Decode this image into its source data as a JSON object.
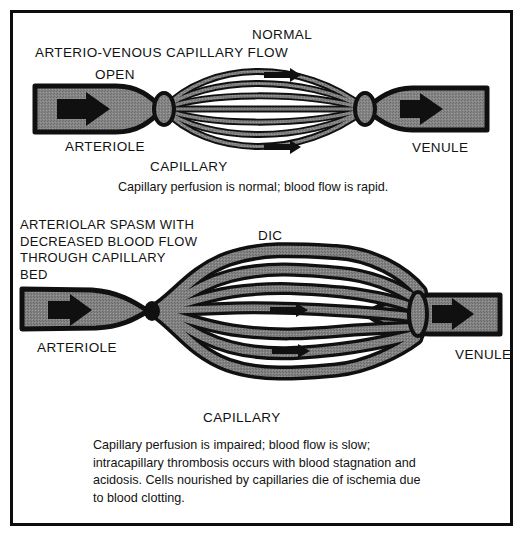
{
  "figure": {
    "background_color": "#ffffff",
    "border_color": "#0d0d0d",
    "vessel_fill_color": "#808080",
    "vessel_outline_color": "#101010",
    "arrow_color": "#101010",
    "text_color": "#121212"
  },
  "panels": [
    {
      "id": "normal",
      "title_top": "NORMAL",
      "title_main": "ARTERIO-VENOUS CAPILLARY FLOW",
      "open_label": "OPEN",
      "arteriole_label": "ARTERIOLE",
      "capillary_label": "CAPILLARY",
      "venule_label": "VENULE",
      "caption": "Capillary perfusion is normal; blood flow is rapid.",
      "flow_arrows": 3,
      "capillary_strands": 7,
      "capillary_shape": "smooth-lens"
    },
    {
      "id": "dic",
      "title_main": "DIC",
      "condition_label": "ARTERIOLAR SPASM WITH\nDECREASED BLOOD FLOW\nTHROUGH CAPILLARY\nBED",
      "arteriole_label": "ARTERIOLE",
      "capillary_label": "CAPILLARY",
      "venule_label": "VENULE",
      "caption": "Capillary perfusion is impaired; blood flow is slow;\nintracapillary thrombosis occurs with blood stagnation and\nacidosis.  Cells nourished by capillaries die of ischemia due\nto blood clotting.",
      "flow_arrows": 4,
      "capillary_strands": 7,
      "capillary_shape": "wavy-engorged"
    }
  ]
}
